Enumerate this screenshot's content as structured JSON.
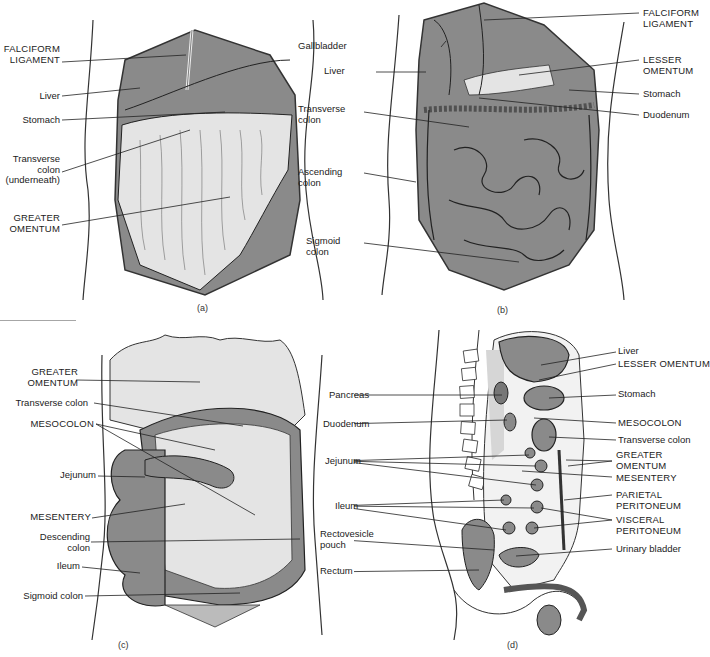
{
  "figure": {
    "panels": [
      {
        "id": "a",
        "caption": "(a)",
        "labels": [
          {
            "text": "FALCIFORM\nLIGAMENT",
            "side": "left"
          },
          {
            "text": "Liver",
            "side": "left"
          },
          {
            "text": "Stomach",
            "side": "left"
          },
          {
            "text": "Transverse\ncolon\n(underneath)",
            "side": "left"
          },
          {
            "text": "GREATER\nOMENTUM",
            "side": "left"
          }
        ]
      },
      {
        "id": "b",
        "caption": "(b)",
        "labels": [
          {
            "text": "Gallbladder",
            "side": "left"
          },
          {
            "text": "Liver",
            "side": "left"
          },
          {
            "text": "Transverse\ncolon",
            "side": "left"
          },
          {
            "text": "Ascending\ncolon",
            "side": "left"
          },
          {
            "text": "Sigmoid\ncolon",
            "side": "left"
          },
          {
            "text": "FALCIFORM\nLIGAMENT",
            "side": "right"
          },
          {
            "text": "LESSER\nOMENTUM",
            "side": "right"
          },
          {
            "text": "Stomach",
            "side": "right"
          },
          {
            "text": "Duodenum",
            "side": "right"
          }
        ]
      },
      {
        "id": "c",
        "caption": "(c)",
        "labels": [
          {
            "text": "GREATER\nOMENTUM",
            "side": "left"
          },
          {
            "text": "Transverse colon",
            "side": "left"
          },
          {
            "text": "MESOCOLON",
            "side": "left"
          },
          {
            "text": "Jejunum",
            "side": "left"
          },
          {
            "text": "MESENTERY",
            "side": "left"
          },
          {
            "text": "Descending\ncolon",
            "side": "left"
          },
          {
            "text": "Ileum",
            "side": "left"
          },
          {
            "text": "Sigmoid colon",
            "side": "left"
          }
        ]
      },
      {
        "id": "d",
        "caption": "(d)",
        "labels": [
          {
            "text": "Pancreas",
            "side": "left"
          },
          {
            "text": "Duodenum",
            "side": "left"
          },
          {
            "text": "Jejunum",
            "side": "left"
          },
          {
            "text": "Ileum",
            "side": "left"
          },
          {
            "text": "Rectovesicle\npouch",
            "side": "left"
          },
          {
            "text": "Rectum",
            "side": "left"
          },
          {
            "text": "Liver",
            "side": "right"
          },
          {
            "text": "LESSER OMENTUM",
            "side": "right"
          },
          {
            "text": "Stomach",
            "side": "right"
          },
          {
            "text": "MESOCOLON",
            "side": "right"
          },
          {
            "text": "Transverse colon",
            "side": "right"
          },
          {
            "text": "GREATER\nOMENTUM",
            "side": "right"
          },
          {
            "text": "MESENTERY",
            "side": "right"
          },
          {
            "text": "PARIETAL\nPERITONEUM",
            "side": "right"
          },
          {
            "text": "VISCERAL\nPERITONEUM",
            "side": "right"
          },
          {
            "text": "Urinary bladder",
            "side": "right"
          }
        ]
      }
    ],
    "colors": {
      "organ_fill": "#8a8a8a",
      "omentum_fill": "#e4e4e4",
      "line": "#222222",
      "background": "#ffffff"
    }
  }
}
